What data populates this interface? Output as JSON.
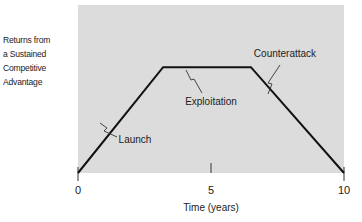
{
  "chart_data": {
    "type": "line",
    "title": "",
    "xlabel": "Time (years)",
    "ylabel_lines": [
      "Returns from",
      "a Sustained",
      "Competitive",
      "Advantage"
    ],
    "xlim": [
      0,
      10
    ],
    "ylim": [
      0,
      1
    ],
    "x_ticks": [
      0,
      5,
      10
    ],
    "x_tick_labels": [
      "0",
      "5",
      "10"
    ],
    "grid": false,
    "background_color": "#dcdcdc",
    "line_color": "#111111",
    "series": [
      {
        "name": "Returns",
        "x": [
          0,
          3.2,
          6.5,
          10
        ],
        "y": [
          0,
          0.63,
          0.63,
          0
        ]
      }
    ],
    "annotations": [
      {
        "text": "Launch",
        "x": 1.0,
        "y": 0.32
      },
      {
        "text": "Exploitation",
        "x": 4.4,
        "y": 0.63
      },
      {
        "text": "Counterattack",
        "x": 7.6,
        "y": 0.44
      }
    ]
  }
}
